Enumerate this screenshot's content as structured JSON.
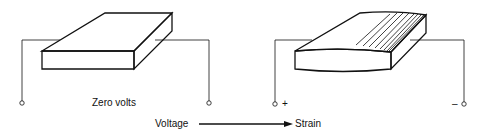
{
  "diagram": {
    "left_state": {
      "label": "Zero volts",
      "terminals": [
        "",
        ""
      ]
    },
    "right_state": {
      "terminal_positive": "+",
      "terminal_negative": "–"
    },
    "flow": {
      "from": "Voltage",
      "to": "Strain"
    },
    "colors": {
      "ink": "#111111",
      "background": "#ffffff"
    }
  }
}
